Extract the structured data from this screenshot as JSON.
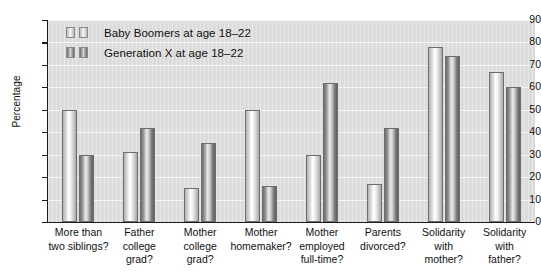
{
  "chart_data": {
    "type": "bar",
    "title": "",
    "xlabel": "",
    "ylabel": "Percentage",
    "ylim": [
      0,
      90
    ],
    "ytick_step": 10,
    "yticks": [
      90,
      80,
      70,
      60,
      50,
      40,
      30,
      20,
      10,
      0
    ],
    "grid": true,
    "legend_position": "top-left",
    "categories": [
      "More than two siblings?",
      "Father college grad?",
      "Mother college grad?",
      "Mother homemaker?",
      "Mother employed full-time?",
      "Parents divorced?",
      "Solidarity with mother?",
      "Solidarity with father?"
    ],
    "category_lines": [
      [
        "More than",
        "two siblings?"
      ],
      [
        "Father",
        "college",
        "grad?"
      ],
      [
        "Mother",
        "college",
        "grad?"
      ],
      [
        "Mother",
        "homemaker?"
      ],
      [
        "Mother",
        "employed",
        "full-time?"
      ],
      [
        "Parents",
        "divorced?"
      ],
      [
        "Solidarity",
        "with",
        "mother?"
      ],
      [
        "Solidarity",
        "with",
        "father?"
      ]
    ],
    "series": [
      {
        "name": "Baby Boomers at age 18–22",
        "style": "light",
        "values": [
          50,
          31,
          15,
          50,
          30,
          17,
          78,
          67
        ]
      },
      {
        "name": "Generation X at age 18–22",
        "style": "dark",
        "values": [
          30,
          42,
          35,
          16,
          62,
          42,
          74,
          60
        ]
      }
    ]
  },
  "legend": {
    "items": [
      {
        "label": "Baby Boomers at age 18–22",
        "style": "light"
      },
      {
        "label": "Generation X at age 18–22",
        "style": "dark"
      }
    ]
  },
  "colors": {
    "plot_background": "#dedede",
    "axis": "#1a1a1a",
    "gridline": "#f4f4f4",
    "bar_light": "#e8e8e8",
    "bar_dark": "#8c8c8c",
    "text": "#111111"
  }
}
